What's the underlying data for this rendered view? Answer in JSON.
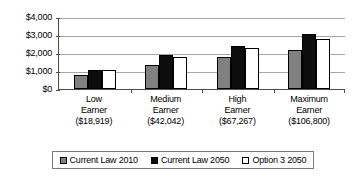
{
  "chart_data": {
    "type": "bar",
    "title": "",
    "xlabel": "",
    "ylabel": "",
    "ylim": [
      0,
      4000
    ],
    "yticks": [
      0,
      1000,
      2000,
      3000,
      4000
    ],
    "ytick_labels": [
      "$0",
      "$1,000",
      "$2,000",
      "$3,000",
      "$4,000"
    ],
    "grid": true,
    "legend_position": "bottom",
    "categories": [
      "Low Earner ($18,919)",
      "Medium Earner ($42,042)",
      "High Earner ($67,267)",
      "Maximum Earner ($106,800)"
    ],
    "category_lines": [
      [
        "Low",
        "Earner",
        "($18,919)"
      ],
      [
        "Medium",
        "Earner",
        "($42,042)"
      ],
      [
        "High",
        "Earner",
        "($67,267)"
      ],
      [
        "Maximum",
        "Earner",
        "($106,800)"
      ]
    ],
    "series": [
      {
        "name": "Current Law 2010",
        "color": "#808080",
        "values": [
          780,
          1350,
          1800,
          2150
        ]
      },
      {
        "name": "Current Law 2050",
        "color": "#0d0d0d",
        "values": [
          1060,
          1900,
          2400,
          3050
        ]
      },
      {
        "name": "Option 3 2050",
        "color": "#ffffff",
        "values": [
          1060,
          1800,
          2300,
          2800
        ]
      }
    ]
  },
  "legend": {
    "items": [
      {
        "label": "Current Law 2010"
      },
      {
        "label": "Current Law 2050"
      },
      {
        "label": "Option 3 2050"
      }
    ]
  },
  "colors": {
    "series_0": "#808080",
    "series_1": "#0d0d0d",
    "series_2": "#ffffff",
    "gridline": "#a6a6a6",
    "axis": "#4d4d4d",
    "legend_border": "#7a7a7a"
  }
}
